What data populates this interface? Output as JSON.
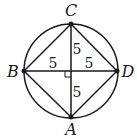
{
  "diagram": {
    "type": "inscribed-square-in-circle",
    "stroke_color": "#1a1a1a",
    "background": "#ffffff",
    "center": {
      "x": 71,
      "y": 71
    },
    "radius": 47,
    "points": [
      {
        "id": "C",
        "label": "C",
        "x": 71,
        "y": 24,
        "lx": 71,
        "ly": 14
      },
      {
        "id": "B",
        "label": "B",
        "x": 24,
        "y": 71,
        "lx": 12,
        "ly": 76
      },
      {
        "id": "D",
        "label": "D",
        "x": 117,
        "y": 71,
        "lx": 129,
        "ly": 76
      },
      {
        "id": "A",
        "label": "A",
        "x": 71,
        "y": 117,
        "lx": 71,
        "ly": 134
      }
    ],
    "segment_labels": [
      {
        "id": "OC",
        "text": "5",
        "x": 77,
        "y": 52
      },
      {
        "id": "BO",
        "text": "5",
        "x": 52,
        "y": 68
      },
      {
        "id": "OD",
        "text": "5",
        "x": 88,
        "y": 68
      },
      {
        "id": "OA",
        "text": "5",
        "x": 77,
        "y": 95
      }
    ],
    "right_angle_marker": {
      "x": 65,
      "y": 71,
      "size": 6
    }
  }
}
